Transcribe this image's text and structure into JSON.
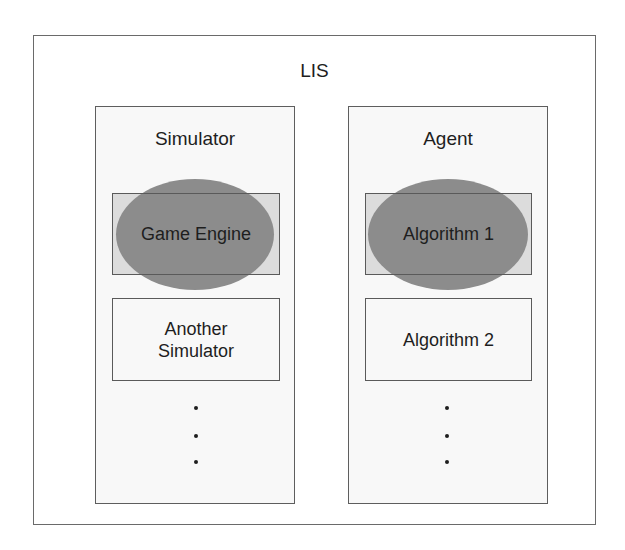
{
  "diagram": {
    "title": "LIS",
    "colors": {
      "outer_border": "#6a6a6a",
      "column_fill": "#f8f8f8",
      "box_fill": "#dcdcdc",
      "ellipse_fill": "#8c8c8c",
      "border": "#5a5a5a",
      "text": "#1e1e1e"
    },
    "columns": [
      {
        "title": "Simulator",
        "highlighted_item": "Game Engine",
        "second_item": "Another Simulator",
        "second_item_lines": [
          "Another",
          "Simulator"
        ],
        "more_indicator": "⋮"
      },
      {
        "title": "Agent",
        "highlighted_item": "Algorithm 1",
        "second_item": "Algorithm 2",
        "more_indicator": "⋮"
      }
    ]
  }
}
